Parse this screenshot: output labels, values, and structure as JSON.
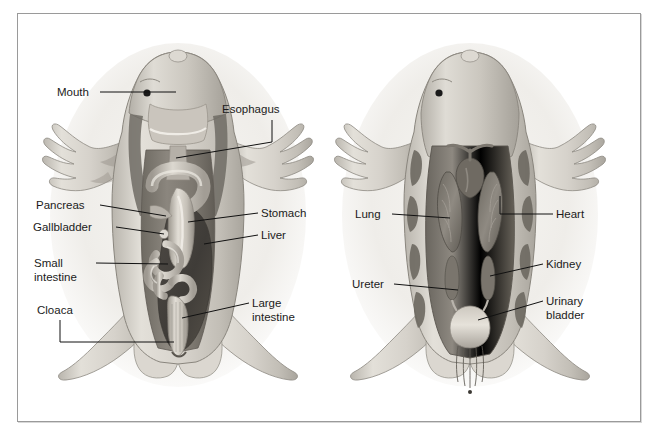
{
  "figure": {
    "background_color": "#ffffff",
    "frame_color": "#9a9a9a",
    "label_color": "#1b1b1b",
    "leader_color": "#111111"
  },
  "panels": [
    {
      "id": "left-panel",
      "name": "digestive-system-view",
      "labels": [
        {
          "id": "mouth",
          "text": "Mouth",
          "x": 57,
          "y": 96,
          "align": "start"
        },
        {
          "id": "esophagus",
          "text": "Esophagus",
          "x": 222,
          "y": 113,
          "align": "start"
        },
        {
          "id": "pancreas",
          "text": "Pancreas",
          "x": 36,
          "y": 209,
          "align": "start"
        },
        {
          "id": "gallbladder",
          "text": "Gallbladder",
          "x": 33,
          "y": 231,
          "align": "start"
        },
        {
          "id": "small-intestine",
          "text": "Small",
          "x": 34,
          "y": 267,
          "align": "start"
        },
        {
          "id": "small-intestine-2",
          "text": "intestine",
          "x": 34,
          "y": 281,
          "align": "start"
        },
        {
          "id": "cloaca",
          "text": "Cloaca",
          "x": 37,
          "y": 314,
          "align": "start"
        },
        {
          "id": "stomach",
          "text": "Stomach",
          "x": 261,
          "y": 217,
          "align": "start"
        },
        {
          "id": "liver",
          "text": "Liver",
          "x": 261,
          "y": 239,
          "align": "start"
        },
        {
          "id": "large-intestine",
          "text": "Large",
          "x": 252,
          "y": 307,
          "align": "start"
        },
        {
          "id": "large-intestine-2",
          "text": "intestine",
          "x": 252,
          "y": 321,
          "align": "start"
        }
      ]
    },
    {
      "id": "right-panel",
      "name": "respiratory-urogenital-view",
      "labels": [
        {
          "id": "lung",
          "text": "Lung",
          "x": 355,
          "y": 218,
          "align": "start"
        },
        {
          "id": "ureter",
          "text": "Ureter",
          "x": 352,
          "y": 288,
          "align": "start"
        },
        {
          "id": "heart",
          "text": "Heart",
          "x": 556,
          "y": 218,
          "align": "start"
        },
        {
          "id": "kidney",
          "text": "Kidney",
          "x": 546,
          "y": 268,
          "align": "start"
        },
        {
          "id": "urinary-bladder",
          "text": "Urinary",
          "x": 546,
          "y": 305,
          "align": "start"
        },
        {
          "id": "urinary-bladder-2",
          "text": "bladder",
          "x": 546,
          "y": 319,
          "align": "start"
        }
      ]
    }
  ],
  "palette": {
    "skin_light": "#e7e4de",
    "skin_mid": "#cfcbc3",
    "skin_shadow": "#b0aca4",
    "skin_dark_patch": "#8e8a82",
    "body_cavity": "#8a857d",
    "body_cavity_dark": "#56524c",
    "organ_mid": "#a39e95",
    "organ_light": "#c8c3ba",
    "organ_highlight": "#ded9d0",
    "organ_dark": "#6e6ا65",
    "page_tint": "#f2f0ec"
  }
}
